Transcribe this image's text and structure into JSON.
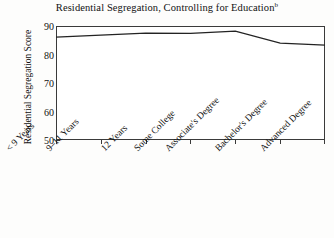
{
  "chart_data": {
    "type": "line",
    "title": "Residential Segregation, Controlling for Education",
    "title_superscript": "b",
    "xlabel": "",
    "ylabel": "Residential Segregation Score",
    "categories": [
      "< 9 Years",
      "9–11 Years",
      "12 Years",
      "Some College",
      "Associate's Degree",
      "Bachelor's Degree",
      "Advanced Degree"
    ],
    "values": [
      86.1,
      86.8,
      87.5,
      87.4,
      88.2,
      84.0,
      83.3
    ],
    "ylim": [
      50,
      90
    ],
    "yticks": [
      50,
      60,
      70,
      80,
      90
    ],
    "ytick_labels": [
      "50",
      "60",
      "70",
      "80",
      "90"
    ],
    "grid": false,
    "legend": false,
    "series": [
      {
        "name": "Residential Segregation Score",
        "values": [
          86.1,
          86.8,
          87.5,
          87.4,
          88.2,
          84.0,
          83.3
        ],
        "color": "#232323"
      }
    ]
  },
  "colors": {
    "line": "#232323",
    "axis": "#3a3a3a",
    "text": "#111111",
    "plot_background": "#ffffff",
    "page_background": "#fdfdfc"
  }
}
